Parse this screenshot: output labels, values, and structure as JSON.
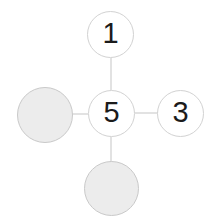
{
  "diagram": {
    "type": "node-graph-cross",
    "background_color": "#ffffff",
    "edge_color": "#d6d6d6",
    "outline_node": {
      "fill_color": "#ffffff",
      "border_color": "#d2d2d2"
    },
    "filled_node": {
      "fill_color": "#ececec",
      "border_color": "#c9c9c9"
    },
    "label_color": "#1b1b1b",
    "nodes": [
      {
        "id": "center",
        "label": "5",
        "state": "outlined",
        "position": "center",
        "cx": 111,
        "cy": 113,
        "r": 23
      },
      {
        "id": "top",
        "label": "1",
        "state": "outlined",
        "position": "top",
        "cx": 110,
        "cy": 34,
        "r": 23
      },
      {
        "id": "right",
        "label": "3",
        "state": "outlined",
        "position": "right",
        "cx": 180,
        "cy": 113,
        "r": 23
      },
      {
        "id": "left",
        "label": "",
        "state": "filled",
        "position": "left",
        "cx": 45,
        "cy": 115,
        "r": 28
      },
      {
        "id": "bottom",
        "label": "",
        "state": "filled",
        "position": "bottom",
        "cx": 111,
        "cy": 188,
        "r": 27
      }
    ],
    "edges": [
      {
        "from": "center",
        "to": "top",
        "x1": 111,
        "y1": 90,
        "x2": 111,
        "y2": 58
      },
      {
        "from": "center",
        "to": "bottom",
        "x1": 111,
        "y1": 137,
        "x2": 111,
        "y2": 162
      },
      {
        "from": "center",
        "to": "left",
        "x1": 88,
        "y1": 113,
        "x2": 72,
        "y2": 114
      },
      {
        "from": "center",
        "to": "right",
        "x1": 135,
        "y1": 113,
        "x2": 158,
        "y2": 113
      }
    ]
  }
}
